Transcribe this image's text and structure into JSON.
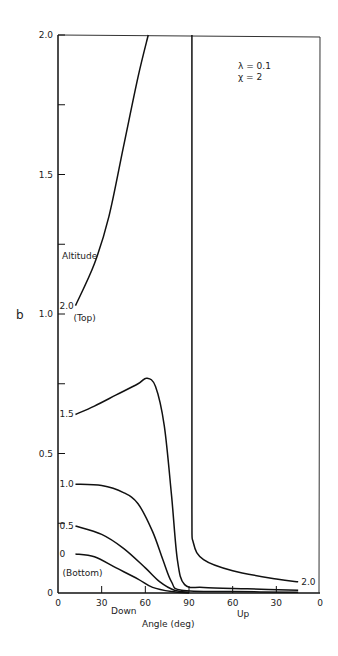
{
  "chart_data": {
    "type": "line",
    "title": "",
    "annotation": [
      "λ = 0.1",
      "χ = 2"
    ],
    "xlabel": "Angle (deg)",
    "x_sublabels": {
      "left": "Down",
      "right": "Up"
    },
    "ylabel": "b",
    "x_tick_labels": [
      "0",
      "30",
      "60",
      "90",
      "60",
      "30",
      "0"
    ],
    "x_tick_positions": [
      0,
      30,
      60,
      90,
      120,
      150,
      180
    ],
    "y_tick_labels": [
      "0",
      "0.5",
      "1.0",
      "1.5",
      "2.0"
    ],
    "xlim": [
      0,
      180
    ],
    "ylim": [
      0,
      2.0
    ],
    "grid": false,
    "legend_title": "Altitude",
    "series": [
      {
        "name": "2.0 (Top)",
        "label": "2.0",
        "sublabel": "(Top)",
        "points": [
          [
            12,
            1.03
          ],
          [
            25,
            1.18
          ],
          [
            35,
            1.35
          ],
          [
            45,
            1.6
          ],
          [
            55,
            1.85
          ],
          [
            62,
            2.0
          ]
        ]
      },
      {
        "name": "2.0 (Top) upward branch",
        "label": "2.0",
        "points": [
          [
            92,
            2.0
          ],
          [
            92,
            1.0
          ],
          [
            92,
            0.3
          ],
          [
            93,
            0.18
          ],
          [
            100,
            0.12
          ],
          [
            120,
            0.08
          ],
          [
            150,
            0.05
          ],
          [
            165,
            0.04
          ]
        ]
      },
      {
        "name": "1.5",
        "label": "1.5",
        "points": [
          [
            12,
            0.64
          ],
          [
            25,
            0.67
          ],
          [
            40,
            0.71
          ],
          [
            55,
            0.75
          ],
          [
            61,
            0.77
          ],
          [
            67,
            0.74
          ],
          [
            73,
            0.6
          ],
          [
            78,
            0.35
          ],
          [
            82,
            0.12
          ],
          [
            87,
            0.03
          ],
          [
            100,
            0.02
          ],
          [
            130,
            0.015
          ],
          [
            165,
            0.01
          ]
        ]
      },
      {
        "name": "1.0",
        "label": "1.0",
        "points": [
          [
            12,
            0.39
          ],
          [
            30,
            0.385
          ],
          [
            45,
            0.36
          ],
          [
            55,
            0.32
          ],
          [
            65,
            0.22
          ],
          [
            72,
            0.12
          ],
          [
            78,
            0.04
          ],
          [
            85,
            0.01
          ],
          [
            120,
            0.005
          ],
          [
            165,
            0.003
          ]
        ]
      },
      {
        "name": "0.5",
        "label": "0.5",
        "points": [
          [
            12,
            0.24
          ],
          [
            30,
            0.21
          ],
          [
            45,
            0.16
          ],
          [
            60,
            0.09
          ],
          [
            70,
            0.04
          ],
          [
            80,
            0.01
          ],
          [
            90,
            0.003
          ]
        ]
      },
      {
        "name": "0 (Bottom)",
        "label": "0",
        "sublabel": "(Bottom)",
        "points": [
          [
            12,
            0.14
          ],
          [
            25,
            0.13
          ],
          [
            40,
            0.09
          ],
          [
            55,
            0.05
          ],
          [
            65,
            0.02
          ],
          [
            78,
            0.005
          ],
          [
            90,
            0.0
          ]
        ]
      }
    ]
  }
}
